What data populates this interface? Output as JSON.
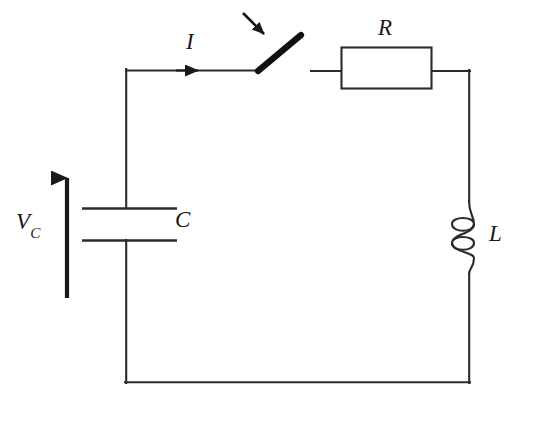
{
  "figure": {
    "kind": "circuit-schematic",
    "background_color": "#ffffff",
    "line_color": "#2b2b2b",
    "ink_color": "#1a1a1a"
  },
  "labels": {
    "resistor": "R",
    "current": "I",
    "capacitor": "C",
    "inductor": "L",
    "capacitor_voltage_main": "V",
    "capacitor_voltage_sub": "C"
  },
  "components": [
    {
      "name": "capacitor",
      "symbol": "C",
      "orientation": "horizontal-plates",
      "position": "left-branch",
      "plate_count": 2
    },
    {
      "name": "switch",
      "symbol": "",
      "state": "open",
      "position": "top-branch",
      "annotation": "arrow-pointer"
    },
    {
      "name": "resistor",
      "symbol": "R",
      "style": "box",
      "position": "top-branch-right"
    },
    {
      "name": "inductor",
      "symbol": "L",
      "style": "coil",
      "loops": 3,
      "position": "right-branch"
    }
  ],
  "annotations": {
    "current_arrow": {
      "name": "current-direction-arrow",
      "direction": "rightward",
      "label": "I"
    },
    "voltage_arrow": {
      "name": "capacitor-voltage-arrow",
      "direction": "upward",
      "label": "V_C"
    },
    "switch_pointer": {
      "name": "switch-pointer-arrow",
      "direction": "down-right"
    }
  }
}
